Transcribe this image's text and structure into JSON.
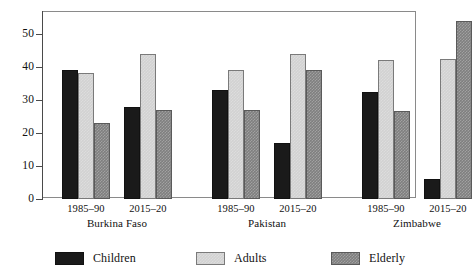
{
  "chart_data": {
    "type": "bar",
    "title": "",
    "subtitle": "",
    "xlabel": "",
    "ylabel": "",
    "ylim": [
      0,
      57
    ],
    "yticks": [
      0,
      10,
      20,
      30,
      40,
      50
    ],
    "ytick_labels": [
      "0",
      "10",
      "20",
      "30",
      "40",
      "50"
    ],
    "grid": false,
    "legend_position": "bottom",
    "categories": [
      "1985–90",
      "2015–20",
      "1985–90",
      "2015–20",
      "1985–90",
      "2015–20"
    ],
    "groups": [
      {
        "country": "Burkina Faso",
        "periods": [
          {
            "label": "1985–90",
            "children": 39,
            "adults": 38,
            "elderly": 23
          },
          {
            "label": "2015–20",
            "children": 28,
            "adults": 44,
            "elderly": 27
          }
        ]
      },
      {
        "country": "Pakistan",
        "periods": [
          {
            "label": "1985–90",
            "children": 33,
            "adults": 39,
            "elderly": 27
          },
          {
            "label": "2015–20",
            "children": 17,
            "adults": 44,
            "elderly": 39
          }
        ]
      },
      {
        "country": "Zimbabwe",
        "periods": [
          {
            "label": "1985–90",
            "children": 32.5,
            "adults": 42,
            "elderly": 26.5
          },
          {
            "label": "2015–20",
            "children": 6,
            "adults": 42.5,
            "elderly": 54
          }
        ]
      }
    ],
    "series": [
      {
        "name": "Children",
        "color": "#1a1a1a",
        "values": [
          39,
          28,
          33,
          17,
          32.5,
          6
        ]
      },
      {
        "name": "Adults",
        "color": "#d2d2d2",
        "values": [
          38,
          44,
          39,
          44,
          42,
          42.5
        ]
      },
      {
        "name": "Elderly",
        "color": "#7f7f7f",
        "values": [
          23,
          27,
          27,
          39,
          26.5,
          54
        ]
      }
    ]
  },
  "axis": {
    "y_labels": [
      "50",
      "40",
      "30",
      "20",
      "10",
      "0"
    ]
  },
  "x_labels": {
    "periods": [
      "1985–90",
      "2015–20",
      "1985–90",
      "2015–20",
      "1985–90",
      "2015–20"
    ],
    "countries": [
      "Burkina Faso",
      "Pakistan",
      "Zimbabwe"
    ]
  },
  "legend": {
    "items": [
      {
        "label": "Children",
        "color": "#1a1a1a"
      },
      {
        "label": "Adults",
        "color": "#d2d2d2"
      },
      {
        "label": "Elderly",
        "color": "#7f7f7f"
      }
    ]
  }
}
